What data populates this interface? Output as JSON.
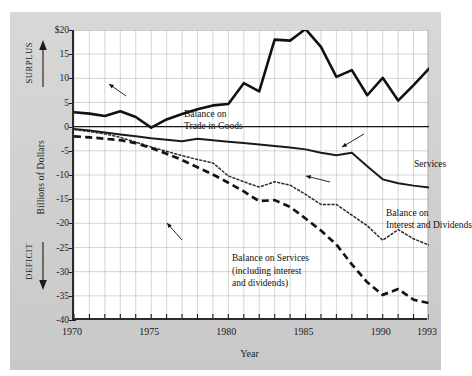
{
  "figure": {
    "top_fragment": "",
    "background_color": "#cfcfcf",
    "plot_background": "#ffffff"
  },
  "axes": {
    "x_title": "Year",
    "y_title": "Billions of Dollars",
    "surplus_label": "SURPLUS",
    "deficit_label": "DEFICIT",
    "y_ticks": [
      "$20",
      "15",
      "10",
      "5",
      "0",
      "-5",
      "-10",
      "-15",
      "-20",
      "-25",
      "-30",
      "-35",
      "-40"
    ],
    "x_ticks": [
      "1970",
      "1975",
      "1980",
      "1985",
      "1990",
      "1993"
    ]
  },
  "annotations": {
    "goods_line1": "Balance on",
    "goods_line2": "Trade in Goods",
    "services": "Services",
    "interest_line1": "Balance on",
    "interest_line2": "Interest and Dividends",
    "balsvc_line1": "Balance on Services",
    "balsvc_line2": "(including interest",
    "balsvc_line3": "and dividends)"
  },
  "chart_data": {
    "type": "line",
    "title": "",
    "xlabel": "Year",
    "ylabel": "Billions of Dollars",
    "xlim": [
      1970,
      1993
    ],
    "ylim": [
      -40,
      20
    ],
    "grid": true,
    "legend": "inline annotations",
    "x": [
      1970,
      1971,
      1972,
      1973,
      1974,
      1975,
      1976,
      1977,
      1978,
      1979,
      1980,
      1981,
      1982,
      1983,
      1984,
      1985,
      1986,
      1987,
      1988,
      1989,
      1990,
      1991,
      1992,
      1993
    ],
    "series": [
      {
        "name": "Balance on Trade in Goods",
        "style": "solid-thick",
        "color": "#111111",
        "values": [
          3.0,
          2.7,
          2.2,
          3.2,
          2.0,
          -0.2,
          1.5,
          2.6,
          3.6,
          4.4,
          4.7,
          9.0,
          7.3,
          18.0,
          17.8,
          20.2,
          16.5,
          10.3,
          11.7,
          6.5,
          10.1,
          5.4,
          8.6,
          12.0
        ]
      },
      {
        "name": "Services",
        "style": "solid-medium",
        "color": "#1a1a1a",
        "values": [
          -0.5,
          -0.8,
          -1.2,
          -1.6,
          -2.0,
          -2.4,
          -2.7,
          -3.0,
          -2.5,
          -2.8,
          -3.1,
          -3.4,
          -3.7,
          -4.0,
          -4.3,
          -4.7,
          -5.4,
          -5.9,
          -5.4,
          -8.2,
          -10.9,
          -11.7,
          -12.2,
          -12.6
        ]
      },
      {
        "name": "Balance on Interest and Dividends",
        "style": "solid-thin-dotted",
        "color": "#2a2a2a",
        "values": [
          -0.6,
          -1.0,
          -1.5,
          -2.2,
          -3.2,
          -4.2,
          -5.1,
          -6.0,
          -6.8,
          -7.5,
          -10.2,
          -11.4,
          -12.5,
          -11.4,
          -12.1,
          -14.0,
          -16.1,
          -16.1,
          -18.3,
          -20.5,
          -23.5,
          -21.3,
          -23.2,
          -24.5
        ]
      },
      {
        "name": "Balance on Services (including interest and dividends)",
        "style": "dashed-thick",
        "color": "#141414",
        "values": [
          -2.0,
          -2.2,
          -2.5,
          -2.8,
          -3.4,
          -4.4,
          -5.6,
          -6.9,
          -8.4,
          -9.9,
          -11.6,
          -13.4,
          -15.4,
          -15.2,
          -16.6,
          -19.0,
          -21.5,
          -24.4,
          -28.5,
          -32.2,
          -34.8,
          -33.6,
          -35.8,
          -36.5
        ]
      }
    ]
  }
}
